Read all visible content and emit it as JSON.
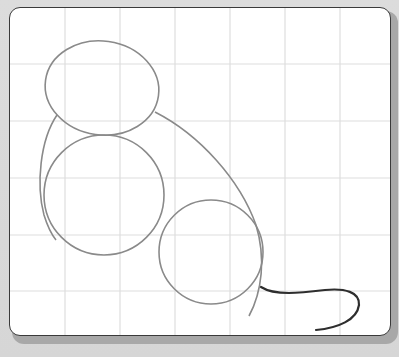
{
  "canvas": {
    "background": "#ffffff",
    "border_color": "#3a3a3a",
    "grid": {
      "color": "#dedede",
      "vertical_lines_x": [
        65,
        120,
        175,
        230,
        285,
        340
      ],
      "horizontal_lines_y": [
        64,
        121,
        178,
        235,
        291
      ]
    }
  },
  "drawing": {
    "subject": "mouse sketch",
    "stroke_color_light": "#8a8a8a",
    "stroke_color_dark": "#2e2e2e",
    "shapes": [
      {
        "name": "head-ellipse",
        "cx": 102,
        "cy": 88,
        "rx": 57,
        "ry": 47,
        "rotate": 8
      },
      {
        "name": "body-circle",
        "cx": 104,
        "cy": 195,
        "r": 60
      },
      {
        "name": "hip-circle",
        "cx": 211,
        "cy": 252,
        "r": 52
      }
    ]
  }
}
